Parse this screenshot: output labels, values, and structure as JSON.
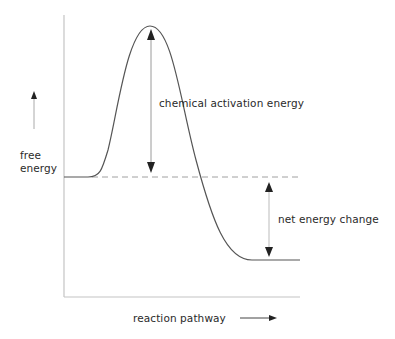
{
  "diagram": {
    "title": "",
    "y_axis_label_line1": "free",
    "y_axis_label_line2": "energy",
    "x_axis_label": "reaction pathway",
    "activation_label": "chemical activation energy",
    "net_change_label": "net energy change"
  },
  "colors": {
    "curve": "#555555",
    "axis": "#bdbdbd",
    "dashed": "#9a9a9a",
    "arrow": "#222222",
    "arrow_shaft": "#bbbbbb",
    "text": "#2a2a2a"
  }
}
